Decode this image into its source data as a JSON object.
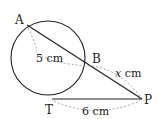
{
  "diagram": {
    "points": {
      "A": {
        "label": "A",
        "x": 27,
        "y": 25
      },
      "B": {
        "label": "B",
        "x": 91,
        "y": 66
      },
      "T": {
        "label": "T",
        "x": 52,
        "y": 99
      },
      "P": {
        "label": "P",
        "x": 142,
        "y": 99
      }
    },
    "circle": {
      "cx": 48,
      "cy": 58,
      "r": 37
    },
    "measurements": {
      "AB": "5 cm",
      "BP": "x cm",
      "TP": "6 cm"
    },
    "colors": {
      "line": "#222222",
      "dashed": "#888888"
    }
  }
}
